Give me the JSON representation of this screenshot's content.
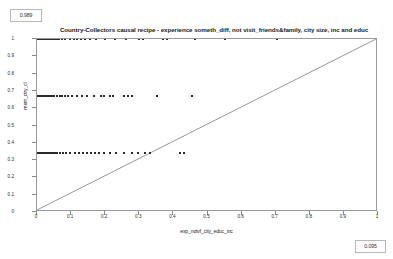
{
  "badges": {
    "consistency": "0.989",
    "coverage": "0.095"
  },
  "chart_data": {
    "type": "scatter",
    "title": "Country-Collectors causal recipe - experience someth_diff, not visit_friends&family, city size, inc and educ",
    "xlabel": "exp_notvf_city_educ_inc",
    "ylabel": "mem_ctry_cl",
    "xlim": [
      0,
      1
    ],
    "ylim": [
      0,
      1
    ],
    "xticks": [
      "0",
      "0.1",
      "0.2",
      "0.3",
      "0.4",
      "0.5",
      "0.6",
      "0.7",
      "0.8",
      "0.9",
      "1"
    ],
    "yticks": [
      "0",
      "0.1",
      "0.2",
      "0.3",
      "0.4",
      "0.5",
      "0.6",
      "0.7",
      "0.8",
      "0.9",
      "1"
    ],
    "grid": false,
    "legend": "none",
    "reference_line": {
      "type": "diagonal",
      "from": [
        0,
        0
      ],
      "to": [
        1,
        1
      ],
      "color": "#6b6b6b"
    },
    "marker_color": "#2b2b2b",
    "points": [
      [
        0.002,
        1
      ],
      [
        0.006,
        1
      ],
      [
        0.009,
        1
      ],
      [
        0.012,
        1
      ],
      [
        0.015,
        1
      ],
      [
        0.018,
        1
      ],
      [
        0.021,
        1
      ],
      [
        0.024,
        1
      ],
      [
        0.027,
        1
      ],
      [
        0.03,
        1
      ],
      [
        0.033,
        1
      ],
      [
        0.036,
        1
      ],
      [
        0.039,
        1
      ],
      [
        0.042,
        1
      ],
      [
        0.045,
        1
      ],
      [
        0.048,
        1
      ],
      [
        0.051,
        1
      ],
      [
        0.054,
        1
      ],
      [
        0.057,
        1
      ],
      [
        0.06,
        1
      ],
      [
        0.064,
        1
      ],
      [
        0.073,
        1
      ],
      [
        0.083,
        1
      ],
      [
        0.097,
        1
      ],
      [
        0.108,
        1
      ],
      [
        0.118,
        1
      ],
      [
        0.129,
        1
      ],
      [
        0.14,
        1
      ],
      [
        0.155,
        1
      ],
      [
        0.172,
        1
      ],
      [
        0.199,
        1
      ],
      [
        0.228,
        1
      ],
      [
        0.262,
        1
      ],
      [
        0.3,
        1
      ],
      [
        0.311,
        1
      ],
      [
        0.369,
        1
      ],
      [
        0.381,
        1
      ],
      [
        0.463,
        1
      ],
      [
        0.552,
        1
      ],
      [
        0.705,
        1
      ],
      [
        0.003,
        0.67
      ],
      [
        0.007,
        0.67
      ],
      [
        0.01,
        0.67
      ],
      [
        0.013,
        0.67
      ],
      [
        0.016,
        0.67
      ],
      [
        0.019,
        0.67
      ],
      [
        0.022,
        0.67
      ],
      [
        0.025,
        0.67
      ],
      [
        0.028,
        0.67
      ],
      [
        0.031,
        0.67
      ],
      [
        0.034,
        0.67
      ],
      [
        0.037,
        0.67
      ],
      [
        0.04,
        0.67
      ],
      [
        0.044,
        0.67
      ],
      [
        0.05,
        0.67
      ],
      [
        0.058,
        0.67
      ],
      [
        0.066,
        0.67
      ],
      [
        0.074,
        0.67
      ],
      [
        0.082,
        0.67
      ],
      [
        0.091,
        0.67
      ],
      [
        0.103,
        0.67
      ],
      [
        0.116,
        0.67
      ],
      [
        0.131,
        0.67
      ],
      [
        0.148,
        0.67
      ],
      [
        0.166,
        0.67
      ],
      [
        0.187,
        0.67
      ],
      [
        0.196,
        0.67
      ],
      [
        0.214,
        0.67
      ],
      [
        0.224,
        0.67
      ],
      [
        0.255,
        0.67
      ],
      [
        0.268,
        0.67
      ],
      [
        0.278,
        0.67
      ],
      [
        0.352,
        0.67
      ],
      [
        0.455,
        0.67
      ],
      [
        0.002,
        0.34
      ],
      [
        0.005,
        0.34
      ],
      [
        0.008,
        0.34
      ],
      [
        0.011,
        0.34
      ],
      [
        0.014,
        0.34
      ],
      [
        0.017,
        0.34
      ],
      [
        0.02,
        0.34
      ],
      [
        0.023,
        0.34
      ],
      [
        0.026,
        0.34
      ],
      [
        0.029,
        0.34
      ],
      [
        0.032,
        0.34
      ],
      [
        0.035,
        0.34
      ],
      [
        0.038,
        0.34
      ],
      [
        0.041,
        0.34
      ],
      [
        0.046,
        0.34
      ],
      [
        0.052,
        0.34
      ],
      [
        0.059,
        0.34
      ],
      [
        0.067,
        0.34
      ],
      [
        0.076,
        0.34
      ],
      [
        0.086,
        0.34
      ],
      [
        0.098,
        0.34
      ],
      [
        0.11,
        0.34
      ],
      [
        0.122,
        0.34
      ],
      [
        0.134,
        0.34
      ],
      [
        0.146,
        0.34
      ],
      [
        0.158,
        0.34
      ],
      [
        0.17,
        0.34
      ],
      [
        0.183,
        0.34
      ],
      [
        0.196,
        0.34
      ],
      [
        0.214,
        0.34
      ],
      [
        0.232,
        0.34
      ],
      [
        0.256,
        0.34
      ],
      [
        0.28,
        0.34
      ],
      [
        0.296,
        0.34
      ],
      [
        0.316,
        0.34
      ],
      [
        0.33,
        0.34
      ],
      [
        0.418,
        0.34
      ],
      [
        0.43,
        0.34
      ]
    ]
  }
}
